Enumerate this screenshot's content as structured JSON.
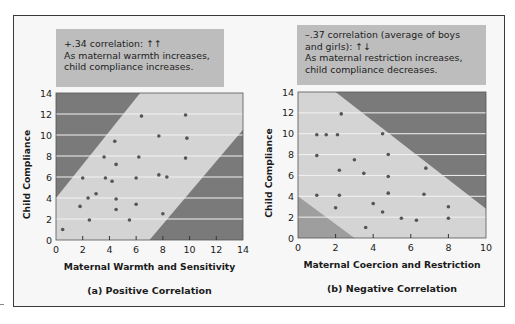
{
  "colors": {
    "frame_bg": "#f7f7f7",
    "caption_bg": "#bdbdbd",
    "plot_dark": "#7a7a7a",
    "plot_light": "#d4d4d4",
    "gridline": "#f2f2f2",
    "point": "#555555"
  },
  "chart_data": [
    {
      "type": "scatter",
      "title": "(a) Positive Correlation",
      "caption": {
        "line1": "+.34 correlation: ↑↑",
        "line2": "As maternal warmth increases,",
        "line3": "child compliance increases."
      },
      "xlabel": "Maternal Warmth and Sensitivity",
      "ylabel": "Child Compliance",
      "xlim": [
        0,
        14
      ],
      "ylim": [
        0,
        14
      ],
      "xticks": [
        "0",
        "2",
        "4",
        "6",
        "8",
        "10",
        "12",
        "14"
      ],
      "yticks": [
        "0",
        "2",
        "4",
        "6",
        "8",
        "10",
        "12",
        "14"
      ],
      "grid": "horizontal",
      "bands": {
        "upper_dark": [
          [
            0,
            4
          ],
          [
            6.3,
            14
          ]
        ],
        "lower_dark": [
          [
            7,
            0
          ],
          [
            14,
            10.5
          ]
        ]
      },
      "points": [
        [
          0.5,
          1.0
        ],
        [
          1.8,
          3.2
        ],
        [
          2.4,
          4.0
        ],
        [
          3.0,
          4.4
        ],
        [
          2.0,
          5.9
        ],
        [
          2.5,
          1.9
        ],
        [
          3.6,
          7.9
        ],
        [
          3.7,
          5.9
        ],
        [
          4.2,
          5.6
        ],
        [
          4.4,
          9.4
        ],
        [
          4.5,
          7.2
        ],
        [
          4.5,
          3.9
        ],
        [
          4.5,
          2.9
        ],
        [
          5.5,
          1.9
        ],
        [
          6.0,
          5.9
        ],
        [
          6.0,
          3.4
        ],
        [
          6.2,
          7.9
        ],
        [
          6.4,
          11.8
        ],
        [
          7.7,
          9.9
        ],
        [
          7.7,
          6.2
        ],
        [
          8.3,
          6.0
        ],
        [
          8.0,
          2.5
        ],
        [
          9.7,
          11.9
        ],
        [
          9.8,
          9.7
        ],
        [
          9.7,
          7.8
        ]
      ]
    },
    {
      "type": "scatter",
      "title": "(b) Negative Correlation",
      "caption": {
        "line1": "–.37 correlation (average of boys",
        "line2": "and girls): ↑↓",
        "line3": "As maternal restriction increases,",
        "line4": "child compliance decreases."
      },
      "xlabel": "Maternal Coercion and Restriction",
      "ylabel": "Child Compliance",
      "xlim": [
        0,
        10
      ],
      "ylim": [
        0,
        14
      ],
      "xticks": [
        "0",
        "2",
        "4",
        "6",
        "8",
        "10"
      ],
      "yticks": [
        "0",
        "2",
        "4",
        "6",
        "8",
        "10",
        "12",
        "14"
      ],
      "grid": "horizontal",
      "bands": {
        "upper_dark": [
          [
            2,
            14
          ],
          [
            10,
            2.8
          ]
        ],
        "lower_dark": [
          [
            0,
            4
          ],
          [
            3,
            0
          ]
        ]
      },
      "points": [
        [
          2.3,
          11.9
        ],
        [
          1.0,
          9.9
        ],
        [
          1.5,
          9.9
        ],
        [
          2.1,
          9.9
        ],
        [
          4.5,
          10.0
        ],
        [
          1.0,
          7.9
        ],
        [
          3.0,
          7.5
        ],
        [
          4.8,
          8.0
        ],
        [
          2.2,
          6.5
        ],
        [
          3.5,
          6.2
        ],
        [
          4.8,
          5.9
        ],
        [
          6.8,
          6.7
        ],
        [
          1.0,
          4.1
        ],
        [
          2.2,
          4.1
        ],
        [
          4.8,
          4.3
        ],
        [
          6.7,
          4.2
        ],
        [
          2.0,
          2.9
        ],
        [
          4.0,
          3.3
        ],
        [
          4.5,
          2.5
        ],
        [
          5.5,
          1.9
        ],
        [
          6.3,
          1.7
        ],
        [
          8.0,
          3.0
        ],
        [
          8.0,
          1.9
        ],
        [
          3.6,
          1.0
        ]
      ]
    }
  ]
}
